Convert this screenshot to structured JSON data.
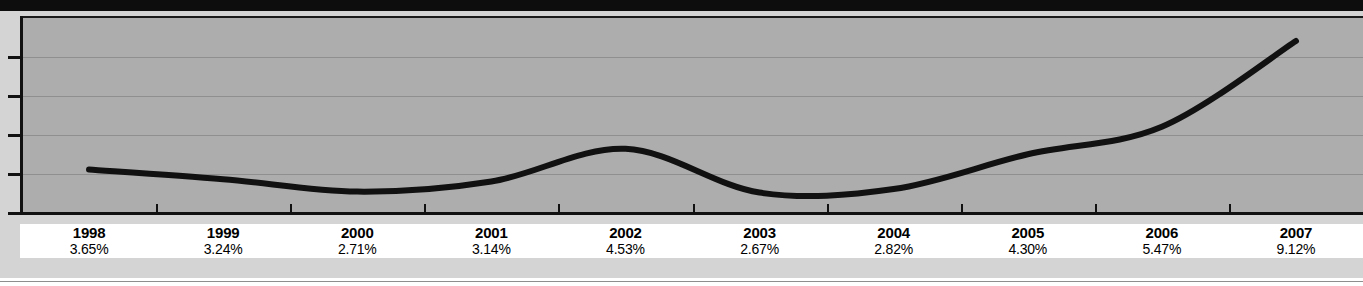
{
  "chart_data": {
    "type": "line",
    "title": "",
    "subtitle": "",
    "xlabel": "",
    "ylabel": "",
    "grid": true,
    "legend": "none",
    "categories": [
      "1998",
      "1999",
      "2000",
      "2001",
      "2002",
      "2003",
      "2004",
      "2005",
      "2006",
      "2007"
    ],
    "values": [
      3.65,
      3.24,
      2.71,
      3.14,
      4.53,
      2.67,
      2.82,
      4.3,
      5.47,
      9.12
    ],
    "value_labels": [
      "3.65%",
      "3.24%",
      "2.71%",
      "3.14%",
      "4.53%",
      "2.67%",
      "2.82%",
      "4.30%",
      "5.47%",
      "9.12%"
    ],
    "unit": "%",
    "ylim": [
      1.8,
      10.1
    ],
    "y_tick_count": 5,
    "y_tick_labels": [
      "",
      "",
      "",
      "",
      ""
    ],
    "line_color": "#111111",
    "plot_background": "#adadad",
    "gridline_color": "#8f8f8f"
  },
  "axis": {
    "y_ticks": [
      "",
      "",
      "",
      "",
      ""
    ],
    "x_ticks": [
      "1998",
      "1999",
      "2000",
      "2001",
      "2002",
      "2003",
      "2004",
      "2005",
      "2006",
      "2007"
    ]
  },
  "table": {
    "columns": [
      {
        "year": "1998",
        "value": "3.65%"
      },
      {
        "year": "1999",
        "value": "3.24%"
      },
      {
        "year": "2000",
        "value": "2.71%"
      },
      {
        "year": "2001",
        "value": "3.14%"
      },
      {
        "year": "2002",
        "value": "4.53%"
      },
      {
        "year": "2003",
        "value": "2.67%"
      },
      {
        "year": "2004",
        "value": "2.82%"
      },
      {
        "year": "2005",
        "value": "4.30%"
      },
      {
        "year": "2006",
        "value": "5.47%"
      },
      {
        "year": "2007",
        "value": "9.12%"
      }
    ]
  },
  "colors": {
    "top_band": "#0d0d0d",
    "page_field": "#d4d4d4",
    "plot_fill": "#adadad",
    "axis": "#111111",
    "label_strip": "#ffffff"
  }
}
